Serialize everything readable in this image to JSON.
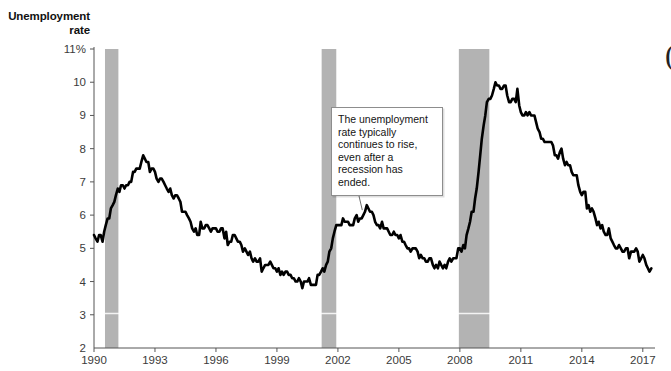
{
  "chart_data": {
    "type": "line",
    "title": "Unemployment rate",
    "title_line1": "Unemployment",
    "title_line2": "rate",
    "xlabel": "",
    "ylabel": "Unemployment rate",
    "xlim": [
      1990,
      2017.6
    ],
    "ylim": [
      2,
      11
    ],
    "grid": false,
    "legend": "none",
    "line_color": "#000000",
    "band_color": "#b3b3b3",
    "axis_color": "#555555",
    "ytick_labels": [
      "11%",
      "10",
      "9",
      "8",
      "7",
      "6",
      "5",
      "4",
      "3",
      "2"
    ],
    "ytick_values": [
      11,
      10,
      9,
      8,
      7,
      6,
      5,
      4,
      3,
      2
    ],
    "xtick_labels": [
      "1990",
      "1993",
      "1996",
      "1999",
      "2002",
      "2005",
      "2008",
      "2011",
      "2014",
      "2017"
    ],
    "xtick_values": [
      1990,
      1993,
      1996,
      1999,
      2002,
      2005,
      2008,
      2011,
      2014,
      2017
    ],
    "annotations": [
      {
        "text": "The unemployment rate typically continues to rise, even after a recession has ended.",
        "points_to_x": 2003.2,
        "points_to_y": 6.15
      }
    ],
    "recession_bands": [
      {
        "start": 1990.54,
        "end": 1991.2,
        "label": "1990-1991 recession"
      },
      {
        "start": 2001.2,
        "end": 2001.92,
        "label": "2001 recession"
      },
      {
        "start": 2007.95,
        "end": 2009.45,
        "label": "2007-2009 recession"
      }
    ],
    "series": [
      {
        "name": "Unemployment rate",
        "x": [
          1990.0,
          1990.08,
          1990.17,
          1990.25,
          1990.33,
          1990.42,
          1990.5,
          1990.58,
          1990.67,
          1990.75,
          1990.83,
          1990.92,
          1991.0,
          1991.08,
          1991.17,
          1991.25,
          1991.33,
          1991.42,
          1991.5,
          1991.58,
          1991.67,
          1991.75,
          1991.83,
          1991.92,
          1992.0,
          1992.08,
          1992.17,
          1992.25,
          1992.33,
          1992.42,
          1992.5,
          1992.58,
          1992.67,
          1992.75,
          1992.83,
          1992.92,
          1993.0,
          1993.08,
          1993.17,
          1993.25,
          1993.33,
          1993.42,
          1993.5,
          1993.58,
          1993.67,
          1993.75,
          1993.83,
          1993.92,
          1994.0,
          1994.08,
          1994.17,
          1994.25,
          1994.33,
          1994.42,
          1994.5,
          1994.58,
          1994.67,
          1994.75,
          1994.83,
          1994.92,
          1995.0,
          1995.08,
          1995.17,
          1995.25,
          1995.33,
          1995.42,
          1995.5,
          1995.58,
          1995.67,
          1995.75,
          1995.83,
          1995.92,
          1996.0,
          1996.08,
          1996.17,
          1996.25,
          1996.33,
          1996.42,
          1996.5,
          1996.58,
          1996.67,
          1996.75,
          1996.83,
          1996.92,
          1997.0,
          1997.08,
          1997.17,
          1997.25,
          1997.33,
          1997.42,
          1997.5,
          1997.58,
          1997.67,
          1997.75,
          1997.83,
          1997.92,
          1998.0,
          1998.08,
          1998.17,
          1998.25,
          1998.33,
          1998.42,
          1998.5,
          1998.58,
          1998.67,
          1998.75,
          1998.83,
          1998.92,
          1999.0,
          1999.08,
          1999.17,
          1999.25,
          1999.33,
          1999.42,
          1999.5,
          1999.58,
          1999.67,
          1999.75,
          1999.83,
          1999.92,
          2000.0,
          2000.08,
          2000.17,
          2000.25,
          2000.33,
          2000.42,
          2000.5,
          2000.58,
          2000.67,
          2000.75,
          2000.83,
          2000.92,
          2001.0,
          2001.08,
          2001.17,
          2001.25,
          2001.33,
          2001.42,
          2001.5,
          2001.58,
          2001.67,
          2001.75,
          2001.83,
          2001.92,
          2002.0,
          2002.08,
          2002.17,
          2002.25,
          2002.33,
          2002.42,
          2002.5,
          2002.58,
          2002.67,
          2002.75,
          2002.83,
          2002.92,
          2003.0,
          2003.08,
          2003.17,
          2003.25,
          2003.33,
          2003.42,
          2003.5,
          2003.58,
          2003.67,
          2003.75,
          2003.83,
          2003.92,
          2004.0,
          2004.08,
          2004.17,
          2004.25,
          2004.33,
          2004.42,
          2004.5,
          2004.58,
          2004.67,
          2004.75,
          2004.83,
          2004.92,
          2005.0,
          2005.08,
          2005.17,
          2005.25,
          2005.33,
          2005.42,
          2005.5,
          2005.58,
          2005.67,
          2005.75,
          2005.83,
          2005.92,
          2006.0,
          2006.08,
          2006.17,
          2006.25,
          2006.33,
          2006.42,
          2006.5,
          2006.58,
          2006.67,
          2006.75,
          2006.83,
          2006.92,
          2007.0,
          2007.08,
          2007.17,
          2007.25,
          2007.33,
          2007.42,
          2007.5,
          2007.58,
          2007.67,
          2007.75,
          2007.83,
          2007.92,
          2008.0,
          2008.08,
          2008.17,
          2008.25,
          2008.33,
          2008.42,
          2008.5,
          2008.58,
          2008.67,
          2008.75,
          2008.83,
          2008.92,
          2009.0,
          2009.08,
          2009.17,
          2009.25,
          2009.33,
          2009.42,
          2009.5,
          2009.58,
          2009.67,
          2009.75,
          2009.83,
          2009.92,
          2010.0,
          2010.08,
          2010.17,
          2010.25,
          2010.33,
          2010.42,
          2010.5,
          2010.58,
          2010.67,
          2010.75,
          2010.83,
          2010.92,
          2011.0,
          2011.08,
          2011.17,
          2011.25,
          2011.33,
          2011.42,
          2011.5,
          2011.58,
          2011.67,
          2011.75,
          2011.83,
          2011.92,
          2012.0,
          2012.08,
          2012.17,
          2012.25,
          2012.33,
          2012.42,
          2012.5,
          2012.58,
          2012.67,
          2012.75,
          2012.83,
          2012.92,
          2013.0,
          2013.08,
          2013.17,
          2013.25,
          2013.33,
          2013.42,
          2013.5,
          2013.58,
          2013.67,
          2013.75,
          2013.83,
          2013.92,
          2014.0,
          2014.08,
          2014.17,
          2014.25,
          2014.33,
          2014.42,
          2014.5,
          2014.58,
          2014.67,
          2014.75,
          2014.83,
          2014.92,
          2015.0,
          2015.08,
          2015.17,
          2015.25,
          2015.33,
          2015.42,
          2015.5,
          2015.58,
          2015.67,
          2015.75,
          2015.83,
          2015.92,
          2016.0,
          2016.08,
          2016.17,
          2016.25,
          2016.33,
          2016.42,
          2016.5,
          2016.58,
          2016.67,
          2016.75,
          2016.83,
          2016.92,
          2017.0,
          2017.08,
          2017.17,
          2017.25,
          2017.33,
          2017.42
        ],
        "values": [
          5.4,
          5.3,
          5.2,
          5.4,
          5.4,
          5.2,
          5.5,
          5.7,
          5.9,
          5.9,
          6.2,
          6.3,
          6.4,
          6.6,
          6.8,
          6.7,
          6.9,
          6.9,
          6.8,
          6.9,
          6.9,
          7.0,
          7.0,
          7.3,
          7.3,
          7.4,
          7.4,
          7.4,
          7.6,
          7.8,
          7.7,
          7.6,
          7.6,
          7.3,
          7.4,
          7.4,
          7.3,
          7.1,
          7.0,
          7.1,
          7.1,
          7.0,
          6.9,
          6.8,
          6.7,
          6.8,
          6.6,
          6.5,
          6.6,
          6.6,
          6.5,
          6.4,
          6.1,
          6.1,
          6.1,
          6.0,
          5.9,
          5.8,
          5.6,
          5.5,
          5.6,
          5.4,
          5.4,
          5.8,
          5.6,
          5.6,
          5.7,
          5.7,
          5.6,
          5.5,
          5.6,
          5.6,
          5.6,
          5.5,
          5.5,
          5.6,
          5.6,
          5.3,
          5.5,
          5.1,
          5.2,
          5.2,
          5.4,
          5.4,
          5.3,
          5.2,
          5.2,
          5.1,
          4.9,
          5.0,
          4.9,
          4.8,
          4.9,
          4.7,
          4.6,
          4.7,
          4.6,
          4.6,
          4.7,
          4.3,
          4.4,
          4.5,
          4.5,
          4.5,
          4.6,
          4.5,
          4.4,
          4.4,
          4.3,
          4.4,
          4.2,
          4.3,
          4.2,
          4.3,
          4.3,
          4.2,
          4.2,
          4.1,
          4.1,
          4.0,
          4.0,
          4.1,
          4.0,
          3.8,
          4.0,
          4.0,
          4.0,
          4.1,
          3.9,
          3.9,
          3.9,
          3.9,
          4.2,
          4.2,
          4.3,
          4.4,
          4.3,
          4.5,
          4.6,
          4.9,
          5.0,
          5.3,
          5.5,
          5.7,
          5.7,
          5.7,
          5.7,
          5.9,
          5.8,
          5.8,
          5.8,
          5.7,
          5.7,
          5.7,
          5.9,
          6.0,
          5.8,
          5.9,
          5.9,
          6.0,
          6.1,
          6.3,
          6.2,
          6.1,
          6.1,
          6.0,
          5.8,
          5.7,
          5.7,
          5.6,
          5.8,
          5.6,
          5.6,
          5.6,
          5.5,
          5.4,
          5.4,
          5.5,
          5.4,
          5.4,
          5.3,
          5.4,
          5.2,
          5.2,
          5.1,
          5.0,
          5.0,
          4.9,
          5.0,
          5.0,
          5.0,
          4.9,
          4.7,
          4.8,
          4.7,
          4.7,
          4.6,
          4.6,
          4.7,
          4.7,
          4.5,
          4.4,
          4.5,
          4.4,
          4.6,
          4.5,
          4.4,
          4.5,
          4.4,
          4.6,
          4.7,
          4.6,
          4.7,
          4.7,
          4.7,
          5.0,
          5.0,
          4.9,
          5.1,
          5.0,
          5.4,
          5.6,
          5.8,
          6.1,
          6.1,
          6.5,
          6.8,
          7.3,
          7.8,
          8.3,
          8.7,
          9.0,
          9.4,
          9.5,
          9.5,
          9.6,
          9.8,
          10.0,
          9.9,
          9.9,
          9.8,
          9.8,
          9.9,
          9.9,
          9.6,
          9.4,
          9.4,
          9.5,
          9.5,
          9.4,
          9.8,
          9.3,
          9.1,
          9.0,
          9.0,
          9.1,
          9.0,
          9.1,
          9.0,
          9.0,
          9.0,
          8.8,
          8.6,
          8.5,
          8.3,
          8.3,
          8.2,
          8.2,
          8.2,
          8.2,
          8.2,
          8.1,
          7.8,
          7.8,
          7.7,
          7.9,
          8.0,
          7.7,
          7.5,
          7.6,
          7.5,
          7.5,
          7.3,
          7.2,
          7.2,
          7.2,
          6.9,
          6.7,
          6.6,
          6.7,
          6.7,
          6.2,
          6.3,
          6.1,
          6.2,
          6.1,
          5.9,
          5.7,
          5.8,
          5.6,
          5.7,
          5.5,
          5.4,
          5.4,
          5.6,
          5.3,
          5.2,
          5.1,
          5.0,
          5.0,
          5.1,
          5.0,
          4.9,
          4.9,
          5.0,
          5.0,
          4.7,
          4.9,
          4.9,
          4.9,
          5.0,
          4.9,
          4.6,
          4.7,
          4.8,
          4.7,
          4.5,
          4.4,
          4.3,
          4.4
        ]
      }
    ]
  },
  "edge_artifact": "("
}
